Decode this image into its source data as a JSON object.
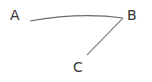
{
  "diagram": {
    "nodes": [
      {
        "id": "A",
        "label": "A",
        "x": 10,
        "y": 8
      },
      {
        "id": "B",
        "label": "B",
        "x": 127,
        "y": 8
      },
      {
        "id": "C",
        "label": "C",
        "x": 73,
        "y": 60
      }
    ],
    "edges": [
      {
        "from": "A",
        "to": "B",
        "style": "curved"
      },
      {
        "from": "B",
        "to": "C",
        "style": "straight"
      }
    ],
    "colors": {
      "line": "#6b6b6b",
      "text": "#333333",
      "background": "#ffffff"
    }
  }
}
